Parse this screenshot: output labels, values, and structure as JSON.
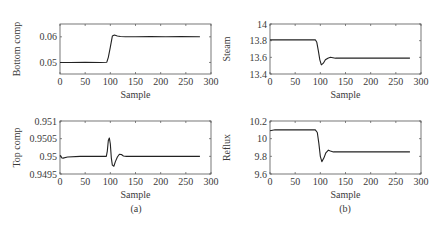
{
  "figure": {
    "captions": [
      "(a)",
      "(b)"
    ]
  },
  "chart_data": [
    {
      "type": "line",
      "panel": "top-left",
      "title": "",
      "xlabel": "Sample",
      "ylabel": "Bottom comp",
      "xlim": [
        0,
        300
      ],
      "ylim": [
        0.0455,
        0.065
      ],
      "xticks": [
        0,
        50,
        100,
        150,
        200,
        250,
        300
      ],
      "yticks": [
        0.05,
        0.06
      ],
      "ytick_labels": [
        "0.05",
        "0.06"
      ],
      "grid": false,
      "series": [
        {
          "name": "Bottom comp",
          "x": [
            0,
            20,
            50,
            80,
            93,
            96,
            100,
            104,
            108,
            114,
            120,
            130,
            150,
            180,
            210,
            240,
            278
          ],
          "y": [
            0.05,
            0.05,
            0.0501,
            0.05,
            0.0501,
            0.052,
            0.056,
            0.0603,
            0.0607,
            0.0603,
            0.0601,
            0.06,
            0.06,
            0.0601,
            0.06,
            0.0601,
            0.06
          ]
        }
      ]
    },
    {
      "type": "line",
      "panel": "top-right",
      "title": "",
      "xlabel": "Sample",
      "ylabel": "Steam",
      "xlim": [
        0,
        300
      ],
      "ylim": [
        13.4,
        14
      ],
      "xticks": [
        0,
        50,
        100,
        150,
        200,
        250,
        300
      ],
      "yticks": [
        13.4,
        13.6,
        13.8,
        14
      ],
      "ytick_labels": [
        "13.4",
        "13.6",
        "13.8",
        "14"
      ],
      "grid": false,
      "series": [
        {
          "name": "Steam",
          "x": [
            0,
            30,
            60,
            90,
            93,
            96,
            99,
            102,
            106,
            110,
            115,
            120,
            130,
            160,
            200,
            240,
            278
          ],
          "y": [
            13.81,
            13.81,
            13.81,
            13.81,
            13.78,
            13.68,
            13.57,
            13.51,
            13.53,
            13.57,
            13.59,
            13.6,
            13.59,
            13.59,
            13.59,
            13.59,
            13.59
          ]
        }
      ]
    },
    {
      "type": "line",
      "panel": "bottom-left",
      "title": "",
      "xlabel": "Sample",
      "ylabel": "Top comp",
      "xlim": [
        0,
        300
      ],
      "ylim": [
        0.9495,
        0.951
      ],
      "xticks": [
        0,
        50,
        100,
        150,
        200,
        250,
        300
      ],
      "yticks": [
        0.9495,
        0.95,
        0.9505,
        0.951
      ],
      "ytick_labels": [
        "0.9495",
        "0.95",
        "0.9505",
        "0.951"
      ],
      "grid": false,
      "series": [
        {
          "name": "Top comp",
          "x": [
            0,
            1,
            3,
            6,
            15,
            40,
            70,
            92,
            94,
            96,
            98,
            100,
            102,
            104,
            107,
            110,
            114,
            118,
            122,
            126,
            132,
            160,
            200,
            240,
            278
          ],
          "y": [
            0.95,
            0.95002,
            0.94996,
            0.94995,
            0.94998,
            0.95,
            0.95,
            0.95,
            0.95015,
            0.95045,
            0.95052,
            0.95035,
            0.94995,
            0.94975,
            0.94972,
            0.94985,
            0.94998,
            0.95006,
            0.95005,
            0.95001,
            0.95,
            0.95,
            0.95,
            0.95,
            0.95
          ]
        }
      ]
    },
    {
      "type": "line",
      "panel": "bottom-right",
      "title": "",
      "xlabel": "Sample",
      "ylabel": "Reflux",
      "xlim": [
        0,
        300
      ],
      "ylim": [
        9.6,
        10.2
      ],
      "xticks": [
        0,
        50,
        100,
        150,
        200,
        250,
        300
      ],
      "yticks": [
        9.6,
        9.8,
        10,
        10.2
      ],
      "ytick_labels": [
        "9.6",
        "9.8",
        "10",
        "10.2"
      ],
      "grid": false,
      "series": [
        {
          "name": "Reflux",
          "x": [
            0,
            10,
            30,
            60,
            90,
            94,
            97,
            100,
            103,
            107,
            111,
            116,
            120,
            126,
            140,
            180,
            220,
            260,
            278
          ],
          "y": [
            10.09,
            10.1,
            10.1,
            10.1,
            10.1,
            10.07,
            9.95,
            9.8,
            9.74,
            9.78,
            9.84,
            9.87,
            9.86,
            9.85,
            9.85,
            9.85,
            9.85,
            9.85,
            9.85
          ]
        }
      ]
    }
  ]
}
